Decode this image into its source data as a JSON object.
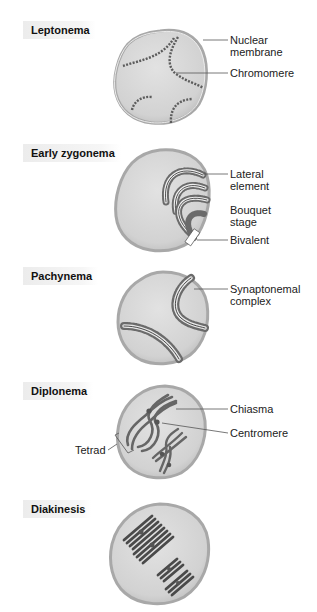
{
  "top_partial_text": "y",
  "stages": [
    {
      "name": "Leptonema",
      "callouts": [
        "Nuclear membrane",
        "Chromomere"
      ]
    },
    {
      "name": "Early zygonema",
      "callouts": [
        "Lateral element",
        "Bouquet stage",
        "Bivalent"
      ]
    },
    {
      "name": "Pachynema",
      "callouts": [
        "Synaptonemal complex"
      ]
    },
    {
      "name": "Diplonema",
      "callouts": [
        "Chiasma",
        "Centromere",
        "Tetrad"
      ]
    },
    {
      "name": "Diakinesis",
      "callouts": []
    }
  ],
  "labels": {
    "leptonema": "Leptonema",
    "early_zygonema": "Early zygonema",
    "pachynema": "Pachynema",
    "diplonema": "Diplonema",
    "diakinesis": "Diakinesis",
    "nuclear_l1": "Nuclear",
    "nuclear_l2": "membrane",
    "chromomere": "Chromomere",
    "lateral_l1": "Lateral",
    "lateral_l2": "element",
    "bouquet_l1": "Bouquet",
    "bouquet_l2": "stage",
    "bivalent": "Bivalent",
    "synaptonemal_l1": "Synaptonemal",
    "synaptonemal_l2": "complex",
    "chiasma": "Chiasma",
    "centromere": "Centromere",
    "tetrad": "Tetrad"
  },
  "colors": {
    "cell_fill": "#d6d6d6",
    "membrane": "#a9a9a9",
    "chromosome": "#5a5a5a",
    "label_bg": "#ececec"
  }
}
